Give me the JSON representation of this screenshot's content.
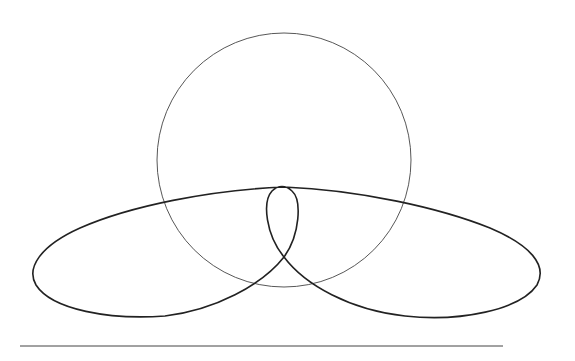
{
  "diagram": {
    "colors": {
      "background": "#ffffff",
      "stroke": "#222222",
      "thin_stroke": "#444444"
    },
    "circle": {
      "cx": 284,
      "cy": 160,
      "r": 127
    },
    "baseline": {
      "x1": 20,
      "y1": 346,
      "x2": 503,
      "y2": 346
    }
  }
}
